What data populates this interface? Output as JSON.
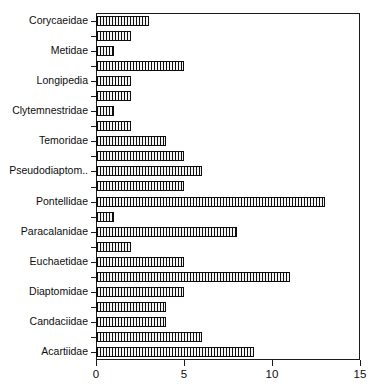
{
  "chart_data": {
    "type": "bar",
    "orientation": "horizontal",
    "title": "",
    "subtitle": "",
    "xlabel": "",
    "ylabel": "",
    "xlim": [
      0,
      15
    ],
    "xticks": [
      0,
      5,
      10,
      15
    ],
    "xtick_labels": [
      "0",
      "5",
      "10",
      "15"
    ],
    "grid": false,
    "legend": null,
    "bar_fill": "#f4f4f4",
    "bar_edge": "#0d0d0d",
    "bar_pattern": "vertical-hatch-dotted",
    "axis_color": "#1a1a1a",
    "note": "Category labels appear on alternating rows only; unlabeled rows have empty category text.",
    "categories": [
      "Corycaeidae",
      "",
      "Metidae",
      "",
      "Longipedia",
      "",
      "Clytemnestridae",
      "",
      "Temoridae",
      "",
      "Pseudodiaptom..",
      "",
      "Pontellidae",
      "",
      "Paracalanidae",
      "",
      "Euchaetidae",
      "",
      "Diaptomidae",
      "",
      "Candaciidae",
      "",
      "Acartiidae"
    ],
    "values": [
      3,
      2,
      1,
      5,
      2,
      2,
      1,
      2,
      4,
      5,
      6,
      5,
      13,
      1,
      8,
      2,
      5,
      11,
      5,
      4,
      4,
      6,
      9
    ],
    "labeled_rows": [
      0,
      2,
      4,
      6,
      8,
      10,
      12,
      14,
      16,
      18,
      20,
      22
    ]
  }
}
